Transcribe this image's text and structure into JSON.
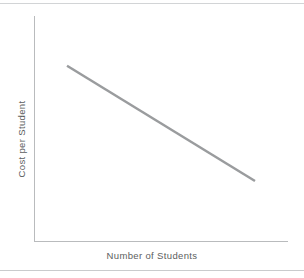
{
  "figure": {
    "width": 304,
    "height": 278,
    "background_color": "#ffffff",
    "axis_color": "#b9bbbd",
    "rule_color": "#d2d4d6",
    "label_color": "#5c5e60",
    "line_color": "#9a9c9e"
  },
  "chart_data": {
    "type": "line",
    "title": "",
    "subtitle": "",
    "xlabel": "Number of Students",
    "ylabel": "Cost per Student",
    "grid": false,
    "legend": null,
    "legend_position": "none",
    "xlim": [
      0,
      100
    ],
    "ylim": [
      0,
      100
    ],
    "xticks": [],
    "yticks": [],
    "xticklabels": [],
    "yticklabels": [],
    "annotations": [],
    "series": [
      {
        "name": "Cost per Student",
        "color": "#9a9c9e",
        "linewidth": 2.5,
        "x": [
          13,
          87
        ],
        "y": [
          78,
          27
        ]
      }
    ]
  }
}
